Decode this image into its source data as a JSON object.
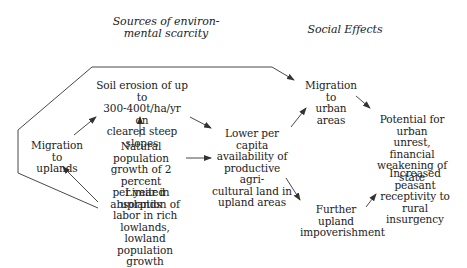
{
  "headers": {
    "sources": "Sources of environ-\nmental scarcity",
    "social": "Social Effects"
  },
  "nodes": {
    "soil_erosion": "Soil erosion of up to\n300-400t/ha/yr on\ncleared steep slopes",
    "migration_uplands": "Migration to\nuplands",
    "natural_growth": "Natural population\ngrowth of 2 percent\nper year in uplands",
    "limited_absorption": "Limited absorption of\nlabor in rich lowlands,\nlowland population\ngrowth",
    "lower_per_capita": "Lower per capita\navailability of\nproductive agri-\ncultural land in\nupland areas",
    "migration_urban": "Migration to\nurban areas",
    "urban_unrest": "Potential for urban\nunrest, financial\nweakening of state",
    "further_impoverishment": "Further upland\nimpoverishment",
    "peasant_receptivity": "Increased peasant\nreceptivity to rural\ninsurgency"
  },
  "colors": {
    "line": "#333333",
    "text": "#222222",
    "background": "#ffffff"
  }
}
